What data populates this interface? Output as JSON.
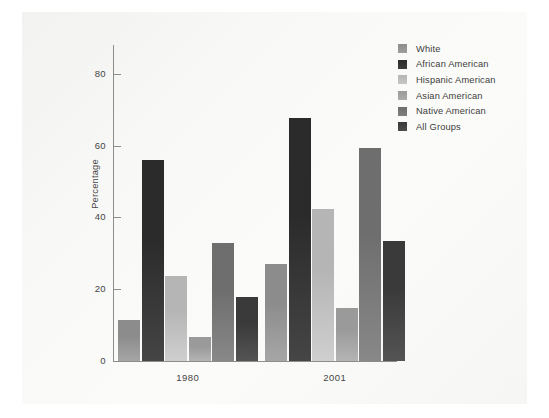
{
  "chart_data": {
    "type": "bar",
    "title": "",
    "subtitle": "",
    "xlabel": "",
    "ylabel": "Percentage",
    "categories": [
      "1980",
      "2001"
    ],
    "ylim": [
      0,
      88
    ],
    "yticks": [
      0,
      20,
      40,
      60,
      80
    ],
    "ytick_labels": [
      "0",
      "20",
      "40",
      "60",
      "80"
    ],
    "grid": false,
    "legend_position": "top-right",
    "series": [
      {
        "name": "White",
        "color": "#8c8c8c",
        "values": [
          11.3,
          27.1
        ]
      },
      {
        "name": "African American",
        "color": "#2b2b2b",
        "values": [
          55.9,
          67.6
        ]
      },
      {
        "name": "Hispanic American",
        "color": "#b5b5b5",
        "values": [
          23.7,
          42.4
        ]
      },
      {
        "name": "Asian American",
        "color": "#9a9a9a",
        "values": [
          6.6,
          14.8
        ]
      },
      {
        "name": "Native American",
        "color": "#6e6e6e",
        "values": [
          32.9,
          59.3
        ]
      },
      {
        "name": "All Groups",
        "color": "#3a3a3a",
        "values": [
          17.9,
          33.4
        ]
      }
    ]
  },
  "legend": {
    "items": [
      {
        "label": "White",
        "swatch": "#8c8c8c"
      },
      {
        "label": "African American",
        "swatch": "#2b2b2b"
      },
      {
        "label": "Hispanic American",
        "swatch": "#b5b5b5"
      },
      {
        "label": "Asian American",
        "swatch": "#9a9a9a"
      },
      {
        "label": "Native American",
        "swatch": "#6e6e6e"
      },
      {
        "label": "All Groups",
        "swatch": "#3a3a3a"
      }
    ]
  },
  "axes": {
    "y_axis_label": "Percentage",
    "y_tick_labels": [
      "0",
      "20",
      "40",
      "60",
      "80"
    ],
    "x_tick_labels": [
      "1980",
      "2001"
    ]
  }
}
